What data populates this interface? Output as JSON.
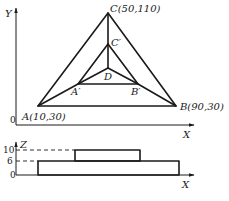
{
  "top_view": {
    "axes": {
      "x_label": "X",
      "y_label": "Y",
      "origin_label": "0"
    },
    "points": {
      "A": {
        "label": "A(10,30)",
        "x": 10,
        "y": 30
      },
      "B": {
        "label": "B(90,30)",
        "x": 90,
        "y": 30
      },
      "C": {
        "label": "C(50,110)",
        "x": 50,
        "y": 110
      },
      "A_prime": {
        "label": "A′"
      },
      "B_prime": {
        "label": "B′"
      },
      "C_prime": {
        "label": "C′"
      },
      "D": {
        "label": "D"
      }
    }
  },
  "front_view": {
    "axes": {
      "x_label": "X",
      "z_label": "Z",
      "origin_label": "0"
    },
    "levels": [
      {
        "label": "10",
        "z": 10
      },
      {
        "label": "6",
        "z": 6
      }
    ]
  }
}
